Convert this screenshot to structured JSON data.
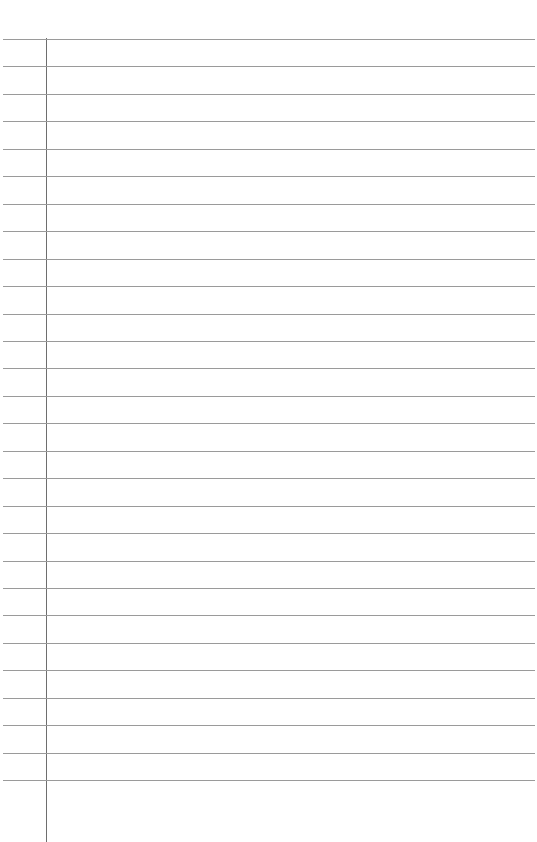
{
  "page": {
    "type": "lined-notebook-page",
    "background_color": "#ffffff",
    "rule_color": "#9a9a9a",
    "margin_color": "#6e6e6e",
    "rule_count": 28,
    "first_rule_y": 39,
    "rule_spacing": 27.45,
    "margin_x": 46,
    "text_content": ""
  }
}
